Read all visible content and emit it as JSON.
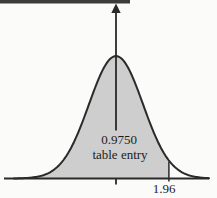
{
  "figure": {
    "background_color": "#fbfbfa",
    "top_bar_color": "#3c3c3c",
    "curve_color": "#2a2a2a",
    "fill_color": "#cecece",
    "axis_color": "#2a2a2a",
    "text_color": "#1c1c1c"
  },
  "chart_data": {
    "type": "area",
    "distribution": "standard-normal",
    "title": "",
    "xlabel": "",
    "ylabel": "",
    "mean": 0,
    "sigma": 1,
    "cutoff_z": 1.96,
    "shaded_area_value": "0.9750",
    "annotation": {
      "line1": "0.9750",
      "line2": "table entry"
    },
    "x_tick_labels": [
      "1.96"
    ],
    "x_range_sigma": [
      -3.8,
      3.5
    ],
    "grid": false,
    "legend": false
  }
}
